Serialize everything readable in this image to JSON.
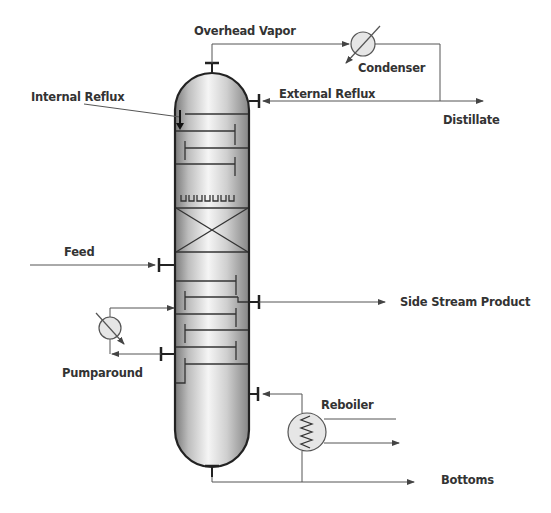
{
  "diagram": {
    "type": "process-flow",
    "colors": {
      "line": "#555555",
      "column_outline": "#222222",
      "column_light": "#f4f4f4",
      "column_dark": "#8a8a8a",
      "exchanger_fill": "#e6e6e6",
      "text": "#333333"
    },
    "labels": {
      "overhead_vapor": "Overhead Vapor",
      "condenser": "Condenser",
      "internal_reflux": "Internal Reflux",
      "external_reflux": "External Reflux",
      "distillate": "Distillate",
      "feed": "Feed",
      "side_stream_product": "Side Stream Product",
      "pumparound": "Pumparound",
      "reboiler": "Reboiler",
      "bottoms": "Bottoms"
    },
    "equipment": [
      {
        "id": "column",
        "kind": "distillation-column"
      },
      {
        "id": "condenser",
        "kind": "heat-exchanger"
      },
      {
        "id": "pumparound-cooler",
        "kind": "heat-exchanger"
      },
      {
        "id": "reboiler",
        "kind": "heat-exchanger-coil"
      }
    ],
    "internals": [
      "tray",
      "tray",
      "tray",
      "tray",
      "distributor",
      "packed-bed",
      "tray",
      "tray",
      "tray",
      "tray",
      "tray",
      "tray"
    ]
  }
}
